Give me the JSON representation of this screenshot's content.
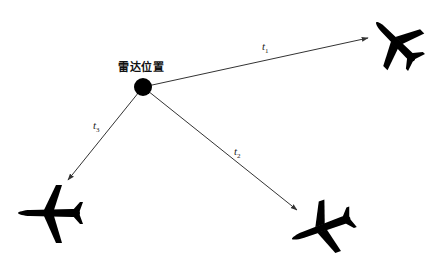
{
  "diagram": {
    "radar": {
      "label": "雷达位置",
      "x": 143,
      "y": 87,
      "r": 9,
      "color": "#000000"
    },
    "paths": [
      {
        "id": "t1",
        "symbol": "t",
        "subscript": "1",
        "from": [
          143,
          87
        ],
        "to": [
          368,
          38
        ],
        "label_pos": [
          262,
          44
        ]
      },
      {
        "id": "t2",
        "symbol": "t",
        "subscript": "2",
        "from": [
          143,
          87
        ],
        "to": [
          297,
          210
        ],
        "label_pos": [
          234,
          148
        ]
      },
      {
        "id": "t3",
        "symbol": "t",
        "subscript": "3",
        "from": [
          143,
          87
        ],
        "to": [
          68,
          180
        ],
        "label_pos": [
          93,
          122
        ]
      }
    ],
    "aircraft": [
      {
        "id": "aircraft-top-right",
        "target_of": "t1"
      },
      {
        "id": "aircraft-bottom-right",
        "target_of": "t2"
      },
      {
        "id": "aircraft-bottom-left",
        "target_of": "t3"
      }
    ],
    "line_color": "#333333",
    "aircraft_color": "#000000"
  }
}
